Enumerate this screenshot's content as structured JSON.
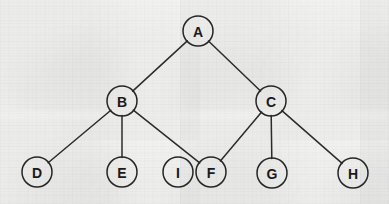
{
  "diagram": {
    "type": "node-link-graph",
    "canvas": {
      "width": 389,
      "height": 204
    },
    "style": {
      "background_color": "#f2f2f1",
      "node_stroke_color": "#262626",
      "node_fill_color": "none",
      "edge_color": "#2c2c2c",
      "label_color": "#1a1a1a",
      "node_radius": 15,
      "edge_width": 1.5
    },
    "nodes": [
      {
        "id": "A",
        "label": "A",
        "cx": 198,
        "cy": 31,
        "r": 15
      },
      {
        "id": "B",
        "label": "B",
        "cx": 122,
        "cy": 101,
        "r": 15
      },
      {
        "id": "C",
        "label": "C",
        "cx": 271,
        "cy": 101,
        "r": 15
      },
      {
        "id": "D",
        "label": "D",
        "cx": 37,
        "cy": 172,
        "r": 15
      },
      {
        "id": "E",
        "label": "E",
        "cx": 122,
        "cy": 172,
        "r": 15
      },
      {
        "id": "I",
        "label": "I",
        "cx": 178,
        "cy": 172,
        "r": 15
      },
      {
        "id": "F",
        "label": "F",
        "cx": 211,
        "cy": 172,
        "r": 15
      },
      {
        "id": "G",
        "label": "G",
        "cx": 272,
        "cy": 173,
        "r": 15
      },
      {
        "id": "H",
        "label": "H",
        "cx": 353,
        "cy": 173,
        "r": 15
      }
    ],
    "edges": [
      {
        "id": "A-B",
        "source": "A",
        "target": "B"
      },
      {
        "id": "A-C",
        "source": "A",
        "target": "C"
      },
      {
        "id": "B-D",
        "source": "B",
        "target": "D"
      },
      {
        "id": "B-E",
        "source": "B",
        "target": "E"
      },
      {
        "id": "B-F",
        "source": "B",
        "target": "F"
      },
      {
        "id": "C-F",
        "source": "C",
        "target": "F"
      },
      {
        "id": "C-G",
        "source": "C",
        "target": "G"
      },
      {
        "id": "C-H",
        "source": "C",
        "target": "H"
      }
    ],
    "isolated_nodes": [
      "I"
    ]
  }
}
